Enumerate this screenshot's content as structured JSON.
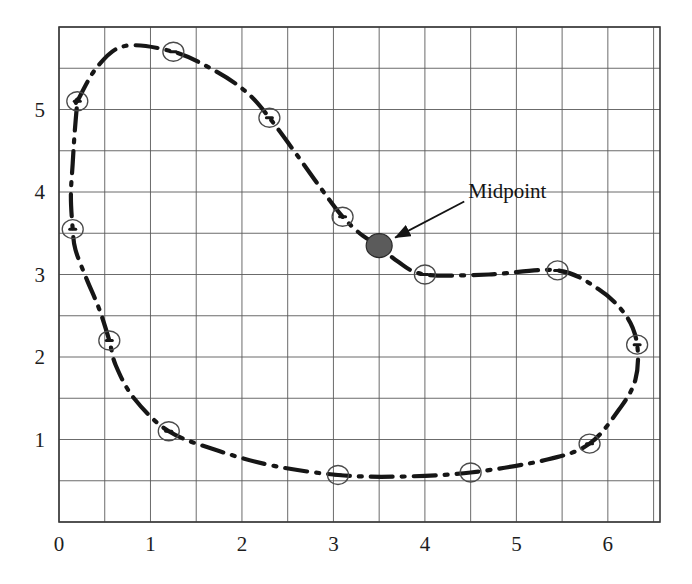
{
  "figure": {
    "title": "",
    "background_color": "#ffffff",
    "ink_color": "#1d1d1d",
    "grid_color": "#5a5a5a"
  },
  "chart_data": {
    "type": "line",
    "title": "",
    "xlabel": "",
    "ylabel": "",
    "xlim": [
      0,
      6.57
    ],
    "ylim": [
      0,
      6.0
    ],
    "grid": true,
    "grid_step_x": 0.5,
    "grid_step_y": 0.5,
    "legend": "none",
    "x_ticks": [
      0,
      1,
      2,
      3,
      4,
      5,
      6
    ],
    "x_tick_labels": [
      "0",
      "1",
      "2",
      "3",
      "4",
      "5",
      "6"
    ],
    "y_ticks": [
      1,
      2,
      3,
      4,
      5
    ],
    "y_tick_labels": [
      "1",
      "2",
      "3",
      "4",
      "5"
    ],
    "curve_style": "dash-dot",
    "curve_closed": true,
    "curve_points": [
      [
        0.2,
        5.1
      ],
      [
        0.42,
        5.52
      ],
      [
        0.72,
        5.77
      ],
      [
        1.25,
        5.7
      ],
      [
        1.72,
        5.46
      ],
      [
        2.06,
        5.2
      ],
      [
        2.3,
        4.9
      ],
      [
        2.62,
        4.42
      ],
      [
        2.86,
        4.05
      ],
      [
        3.1,
        3.7
      ],
      [
        3.32,
        3.47
      ],
      [
        3.5,
        3.35
      ],
      [
        3.7,
        3.16
      ],
      [
        4.0,
        3.0
      ],
      [
        4.7,
        3.0
      ],
      [
        5.45,
        3.05
      ],
      [
        5.9,
        2.82
      ],
      [
        6.2,
        2.5
      ],
      [
        6.32,
        2.15
      ],
      [
        6.3,
        1.72
      ],
      [
        6.12,
        1.36
      ],
      [
        5.8,
        0.95
      ],
      [
        5.35,
        0.76
      ],
      [
        4.5,
        0.6
      ],
      [
        3.7,
        0.55
      ],
      [
        3.05,
        0.57
      ],
      [
        2.35,
        0.68
      ],
      [
        1.75,
        0.86
      ],
      [
        1.2,
        1.1
      ],
      [
        0.82,
        1.5
      ],
      [
        0.62,
        1.9
      ],
      [
        0.55,
        2.2
      ],
      [
        0.44,
        2.58
      ],
      [
        0.3,
        2.95
      ],
      [
        0.18,
        3.3
      ],
      [
        0.15,
        3.55
      ],
      [
        0.13,
        3.95
      ],
      [
        0.15,
        4.35
      ],
      [
        0.17,
        4.7
      ],
      [
        0.2,
        5.1
      ]
    ],
    "node_markers": [
      {
        "x": 0.2,
        "y": 5.1
      },
      {
        "x": 1.25,
        "y": 5.7
      },
      {
        "x": 2.3,
        "y": 4.9
      },
      {
        "x": 3.1,
        "y": 3.7
      },
      {
        "x": 4.0,
        "y": 3.0
      },
      {
        "x": 5.45,
        "y": 3.05
      },
      {
        "x": 6.32,
        "y": 2.15
      },
      {
        "x": 5.8,
        "y": 0.95
      },
      {
        "x": 4.5,
        "y": 0.6
      },
      {
        "x": 3.05,
        "y": 0.57
      },
      {
        "x": 1.2,
        "y": 1.1
      },
      {
        "x": 0.55,
        "y": 2.2
      },
      {
        "x": 0.15,
        "y": 3.55
      }
    ],
    "highlight_point": {
      "label": "Midpoint",
      "x": 3.5,
      "y": 3.35,
      "fill": "#5b5b5b",
      "stroke": "#2a2a2a"
    },
    "annotations": [
      {
        "text": "Midpoint",
        "target_x": 3.5,
        "target_y": 3.35,
        "text_x": 4.43,
        "text_y": 3.86,
        "arrow": true
      }
    ]
  },
  "annotation": {
    "midpoint_label": "Midpoint"
  }
}
